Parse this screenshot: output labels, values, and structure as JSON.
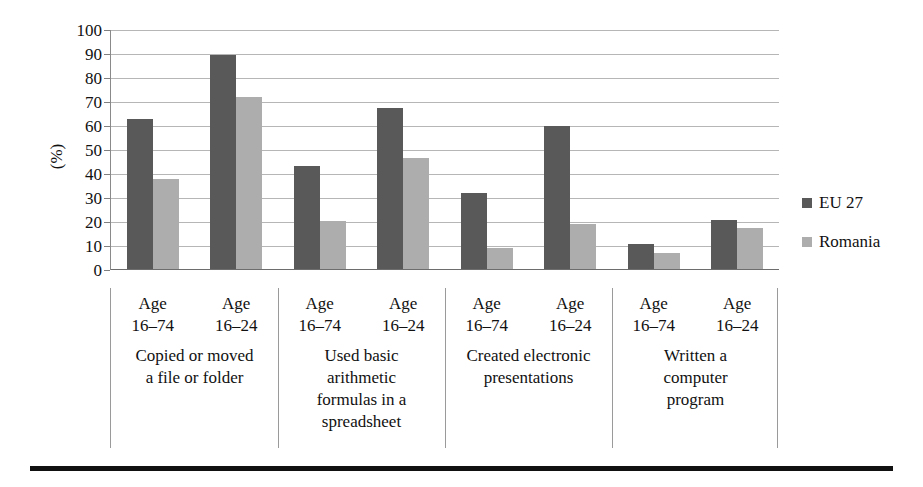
{
  "chart_data": {
    "type": "bar",
    "title": "",
    "xlabel": "",
    "ylabel": "(%)",
    "ylim": [
      0,
      100
    ],
    "ytick_step": 10,
    "yticks": [
      "100",
      "90",
      "80",
      "70",
      "60",
      "50",
      "40",
      "30",
      "20",
      "10",
      "0"
    ],
    "grid": true,
    "legend_position": "right",
    "series": [
      {
        "name": "EU 27",
        "color": "#595959",
        "values": [
          63,
          89.5,
          43.5,
          67.5,
          32,
          60,
          11,
          21
        ]
      },
      {
        "name": "Romania",
        "color": "#adadad",
        "values": [
          38,
          72,
          20.5,
          46.5,
          9,
          19,
          7,
          17.5
        ]
      }
    ],
    "categories": [
      "Age 16–74",
      "Age 16–24",
      "Age 16–74",
      "Age 16–24",
      "Age 16–74",
      "Age 16–24",
      "Age 16–74",
      "Age 16–24"
    ],
    "groups": [
      {
        "label": "Copied or moved a file or folder",
        "ages": [
          "Age 16–74",
          "Age 16–24"
        ]
      },
      {
        "label": "Used basic arithmetic formulas in a spreadsheet",
        "ages": [
          "Age 16–74",
          "Age 16–24"
        ]
      },
      {
        "label": "Created electronic presentations",
        "ages": [
          "Age 16–74",
          "Age 16–24"
        ]
      },
      {
        "label": "Written a computer program",
        "ages": [
          "Age 16–74",
          "Age 16–24"
        ]
      }
    ]
  },
  "axis": {
    "y_title": "(%)",
    "ticks": [
      "100",
      "90",
      "80",
      "70",
      "60",
      "50",
      "40",
      "30",
      "20",
      "10",
      "0"
    ]
  },
  "legend": {
    "items": [
      {
        "label": "EU 27",
        "color": "#595959"
      },
      {
        "label": "Romania",
        "color": "#adadad"
      }
    ]
  },
  "groups": [
    {
      "title_line1": "Copied or moved",
      "title_line2": "a file or folder",
      "title_line3": "",
      "title_line4": "",
      "age1_line1": "Age",
      "age1_line2": "16–74",
      "age2_line1": "Age",
      "age2_line2": "16–24"
    },
    {
      "title_line1": "Used basic",
      "title_line2": "arithmetic",
      "title_line3": "formulas in a",
      "title_line4": "spreadsheet",
      "age1_line1": "Age",
      "age1_line2": "16–74",
      "age2_line1": "Age",
      "age2_line2": "16–24"
    },
    {
      "title_line1": "Created electronic",
      "title_line2": "presentations",
      "title_line3": "",
      "title_line4": "",
      "age1_line1": "Age",
      "age1_line2": "16–74",
      "age2_line1": "Age",
      "age2_line2": "16–24"
    },
    {
      "title_line1": "Written a",
      "title_line2": "computer",
      "title_line3": "program",
      "title_line4": "",
      "age1_line1": "Age",
      "age1_line2": "16–74",
      "age2_line1": "Age",
      "age2_line2": "16–24"
    }
  ]
}
